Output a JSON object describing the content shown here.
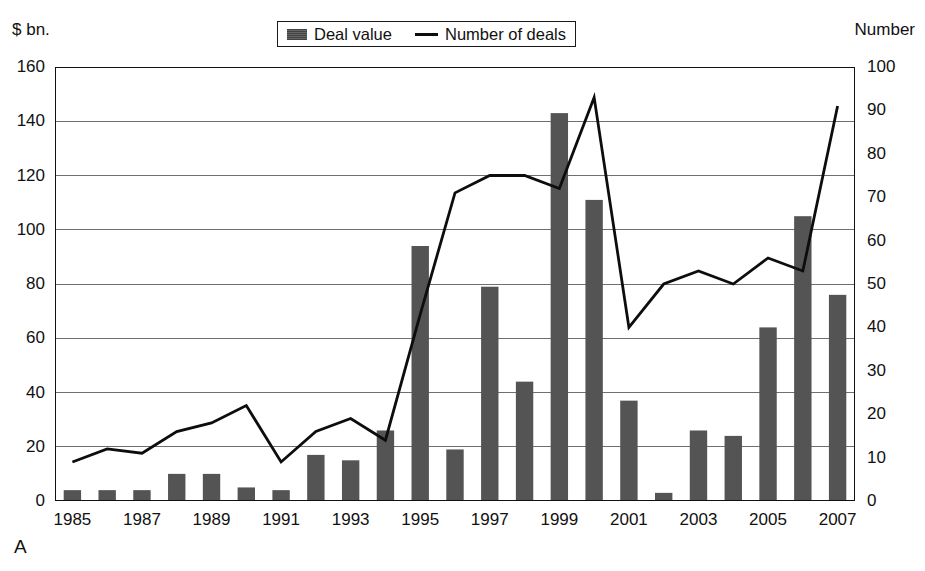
{
  "caption": {
    "cropped_header_text": "………………………………………"
  },
  "panel_letter": "A",
  "legend": {
    "items": [
      {
        "label": "Deal value",
        "marker": "bar-swatch-icon",
        "color": "#545454"
      },
      {
        "label": "Number of deals",
        "marker": "line-swatch-icon",
        "color": "#0d0d0d"
      }
    ]
  },
  "chart_data": {
    "type": "bar",
    "title": "",
    "subtitle": "",
    "xlabel": "",
    "ylabel": "$ bn.",
    "y2label": "Number",
    "ylim": [
      0,
      160
    ],
    "y2lim": [
      0,
      100
    ],
    "yticks": [
      0,
      20,
      40,
      60,
      80,
      100,
      120,
      140,
      160
    ],
    "y2ticks": [
      0,
      10,
      20,
      30,
      40,
      50,
      60,
      70,
      80,
      90,
      100
    ],
    "grid": true,
    "legend_position": "top-center",
    "categories": [
      "1985",
      "1986",
      "1987",
      "1988",
      "1989",
      "1990",
      "1991",
      "1992",
      "1993",
      "1994",
      "1995",
      "1996",
      "1997",
      "1998",
      "1999",
      "2000",
      "2001",
      "2002",
      "2003",
      "2004",
      "2005",
      "2006",
      "2007"
    ],
    "xtick_labels": [
      "1985",
      "",
      "1987",
      "",
      "1989",
      "",
      "1991",
      "",
      "1993",
      "",
      "1995",
      "",
      "1997",
      "",
      "1999",
      "",
      "2001",
      "",
      "2003",
      "",
      "2005",
      "",
      "2007"
    ],
    "series": [
      {
        "name": "Deal value",
        "type": "bar",
        "axis": "left",
        "unit": "$ bn.",
        "color": "#545454",
        "values": [
          4,
          4,
          4,
          10,
          10,
          5,
          4,
          17,
          15,
          26,
          94,
          19,
          79,
          44,
          143,
          111,
          37,
          3,
          26,
          24,
          64,
          105,
          76
        ]
      },
      {
        "name": "Number of deals",
        "type": "line",
        "axis": "right",
        "unit": "Number",
        "color": "#0d0d0d",
        "values": [
          9,
          12,
          11,
          16,
          18,
          22,
          9,
          16,
          19,
          14,
          43,
          71,
          75,
          75,
          72,
          93,
          40,
          50,
          53,
          50,
          56,
          53,
          91
        ]
      }
    ]
  }
}
